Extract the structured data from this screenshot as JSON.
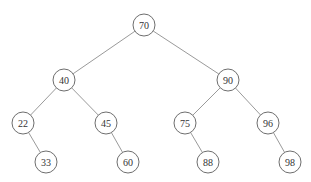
{
  "diagram": {
    "type": "binary-search-tree",
    "nodes": [
      {
        "id": "n70",
        "label": "70",
        "x": 144,
        "y": 25
      },
      {
        "id": "n40",
        "label": "40",
        "x": 64,
        "y": 80
      },
      {
        "id": "n90",
        "label": "90",
        "x": 228,
        "y": 80
      },
      {
        "id": "n22",
        "label": "22",
        "x": 23,
        "y": 123
      },
      {
        "id": "n45",
        "label": "45",
        "x": 106,
        "y": 123
      },
      {
        "id": "n75",
        "label": "75",
        "x": 185,
        "y": 123
      },
      {
        "id": "n96",
        "label": "96",
        "x": 268,
        "y": 123
      },
      {
        "id": "n33",
        "label": "33",
        "x": 46,
        "y": 162
      },
      {
        "id": "n60",
        "label": "60",
        "x": 128,
        "y": 162
      },
      {
        "id": "n88",
        "label": "88",
        "x": 208,
        "y": 162
      },
      {
        "id": "n98",
        "label": "98",
        "x": 290,
        "y": 162
      }
    ],
    "edges": [
      {
        "from": "n70",
        "to": "n40"
      },
      {
        "from": "n70",
        "to": "n90"
      },
      {
        "from": "n40",
        "to": "n22"
      },
      {
        "from": "n40",
        "to": "n45"
      },
      {
        "from": "n90",
        "to": "n75"
      },
      {
        "from": "n90",
        "to": "n96"
      },
      {
        "from": "n22",
        "to": "n33"
      },
      {
        "from": "n45",
        "to": "n60"
      },
      {
        "from": "n75",
        "to": "n88"
      },
      {
        "from": "n96",
        "to": "n98"
      }
    ],
    "node_radius": 11,
    "colors": {
      "edge": "#9a9a9a",
      "node_stroke": "#6e6e6e",
      "text": "#333333",
      "background": "#ffffff"
    }
  }
}
